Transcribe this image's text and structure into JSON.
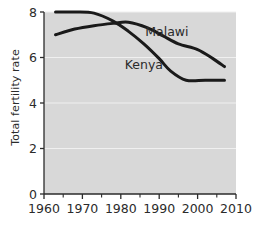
{
  "chart_data": {
    "type": "line",
    "title": "",
    "subtitle": "",
    "xlabel": "",
    "ylabel": "Total fertility rate",
    "xlim": [
      1960,
      2010
    ],
    "ylim": [
      0,
      8
    ],
    "xticks": [
      1960,
      1970,
      1980,
      1990,
      2000,
      2010
    ],
    "xtick_labels": [
      "1960",
      "1970",
      "1980",
      "1990",
      "2000",
      "2010"
    ],
    "x_minor_ticks": [
      1965,
      1975,
      1985,
      1995,
      2005
    ],
    "yticks": [
      0,
      2,
      4,
      6,
      8
    ],
    "ytick_labels": [
      "0",
      "2",
      "4",
      "6",
      "8"
    ],
    "grid": "horizontal-major-only",
    "grid_color": "#f0f0f0",
    "plot_background": "#d8d8d8",
    "figure_background": "#ffffff",
    "line_color": "#1a1a1a",
    "line_width": 3,
    "legend": "inline-annotations",
    "series": [
      {
        "name": "Malawi",
        "label_year": 1992,
        "label_value": 6.95,
        "x": [
          1963,
          1968,
          1973,
          1978,
          1982,
          1987,
          1991,
          1995,
          2000,
          2004,
          2007
        ],
        "values": [
          7.0,
          7.25,
          7.4,
          7.5,
          7.55,
          7.3,
          6.95,
          6.6,
          6.35,
          5.95,
          5.6
        ]
      },
      {
        "name": "Kenya",
        "label_year": 1986,
        "label_value": 5.5,
        "x": [
          1963,
          1968,
          1973,
          1978,
          1982,
          1986,
          1990,
          1993,
          1997,
          2002,
          2007
        ],
        "values": [
          8.0,
          8.0,
          7.95,
          7.6,
          7.15,
          6.6,
          5.95,
          5.4,
          5.0,
          5.0,
          5.0
        ]
      }
    ]
  }
}
